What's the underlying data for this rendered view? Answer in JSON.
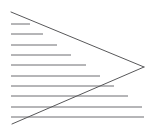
{
  "figure": {
    "type": "line-drawing",
    "canvas": {
      "width": 155,
      "height": 134,
      "background": "#ffffff"
    },
    "stroke": {
      "color": "#58585a",
      "width": 1,
      "hatch_color": "#6d6d70",
      "hatch_width": 1
    },
    "triangle": {
      "name": "hatched-triangle",
      "apex": {
        "x": 144,
        "y": 67
      },
      "top_left": {
        "x": 11,
        "y": 12
      },
      "bottom_left": {
        "x": 12,
        "y": 124
      },
      "orientation": "points-right",
      "closed_left_edge": false
    },
    "hatch": {
      "orientation": "horizontal",
      "count": 10,
      "left_x": 11,
      "spacing": 10.4,
      "first_y": 24,
      "last_y": 117,
      "lines": [
        {
          "index": 1,
          "y": 24,
          "x1": 11,
          "x2": 30
        },
        {
          "index": 2,
          "y": 34,
          "x1": 11,
          "x2": 43
        },
        {
          "index": 3,
          "y": 45,
          "x1": 11,
          "x2": 57
        },
        {
          "index": 4,
          "y": 55,
          "x1": 11,
          "x2": 71
        },
        {
          "index": 5,
          "y": 65,
          "x1": 11,
          "x2": 86
        },
        {
          "index": 6,
          "y": 76,
          "x1": 11,
          "x2": 100
        },
        {
          "index": 7,
          "y": 86,
          "x1": 11,
          "x2": 114
        },
        {
          "index": 8,
          "y": 96,
          "x1": 11,
          "x2": 128
        },
        {
          "index": 9,
          "y": 107,
          "x1": 11,
          "x2": 142
        },
        {
          "index": 10,
          "y": 117,
          "x1": 11,
          "x2": 144
        }
      ]
    },
    "chart_data": {
      "type": "line",
      "title": "Right-pointing triangle with horizontal hatch lines",
      "xlabel": "",
      "ylabel": "",
      "xlim": [
        0,
        155
      ],
      "ylim": [
        0,
        134
      ],
      "grid": false,
      "legend": "none",
      "series": [
        {
          "name": "upper-diagonal-edge",
          "x": [
            11,
            144
          ],
          "values": [
            12,
            67
          ]
        },
        {
          "name": "lower-diagonal-edge",
          "x": [
            12,
            144
          ],
          "values": [
            124,
            67
          ]
        },
        {
          "name": "hatch-line-1",
          "x": [
            11,
            30
          ],
          "values": [
            24,
            24
          ]
        },
        {
          "name": "hatch-line-2",
          "x": [
            11,
            43
          ],
          "values": [
            34,
            34
          ]
        },
        {
          "name": "hatch-line-3",
          "x": [
            11,
            57
          ],
          "values": [
            45,
            45
          ]
        },
        {
          "name": "hatch-line-4",
          "x": [
            11,
            71
          ],
          "values": [
            55,
            55
          ]
        },
        {
          "name": "hatch-line-5",
          "x": [
            11,
            86
          ],
          "values": [
            65,
            65
          ]
        },
        {
          "name": "hatch-line-6",
          "x": [
            11,
            100
          ],
          "values": [
            76,
            76
          ]
        },
        {
          "name": "hatch-line-7",
          "x": [
            11,
            114
          ],
          "values": [
            86,
            86
          ]
        },
        {
          "name": "hatch-line-8",
          "x": [
            11,
            128
          ],
          "values": [
            96,
            96
          ]
        },
        {
          "name": "hatch-line-9",
          "x": [
            11,
            142
          ],
          "values": [
            107,
            107
          ]
        },
        {
          "name": "hatch-line-10",
          "x": [
            11,
            144
          ],
          "values": [
            117,
            117
          ]
        }
      ]
    }
  }
}
